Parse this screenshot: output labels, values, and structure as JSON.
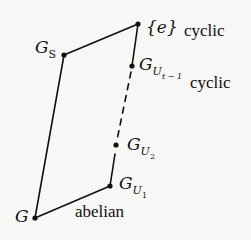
{
  "diagram": {
    "type": "subgroup-lattice",
    "nodes": [
      {
        "id": "G",
        "label_main": "G",
        "x": 35,
        "y": 218
      },
      {
        "id": "GS",
        "label_main": "G",
        "label_sub": "S",
        "x": 64,
        "y": 55
      },
      {
        "id": "e",
        "label_main": "{e}",
        "x": 138,
        "y": 24
      },
      {
        "id": "GUt1",
        "label_main": "G",
        "label_sub": "U",
        "label_subsub": "t − 1",
        "x": 132,
        "y": 66
      },
      {
        "id": "GU2",
        "label_main": "G",
        "label_sub": "U",
        "label_subsub": "2",
        "x": 116,
        "y": 145
      },
      {
        "id": "GU1",
        "label_main": "G",
        "label_sub": "U",
        "label_subsub": "1",
        "x": 110,
        "y": 186
      }
    ],
    "edges": [
      {
        "from": "G",
        "to": "GS",
        "style": "solid"
      },
      {
        "from": "GS",
        "to": "e",
        "style": "solid"
      },
      {
        "from": "e",
        "to": "GUt1",
        "style": "solid"
      },
      {
        "from": "GUt1",
        "to": "GU2",
        "style": "dashed"
      },
      {
        "from": "GU2",
        "to": "GU1",
        "style": "solid"
      },
      {
        "from": "GU1",
        "to": "G",
        "style": "solid"
      }
    ],
    "annotations": {
      "e_cyclic": "cyclic",
      "GUt1_cyclic": "cyclic",
      "G_abelian": "abelian"
    },
    "labels": {
      "G": "G",
      "GS_main": "G",
      "GS_sub": "S",
      "e": "{e}",
      "GUt1_main": "G",
      "GUt1_sub": "U",
      "GUt1_subsub": "t − 1",
      "GU2_main": "G",
      "GU2_sub": "U",
      "GU2_subsub": "2",
      "GU1_main": "G",
      "GU1_sub": "U",
      "GU1_subsub": "1"
    },
    "colors": {
      "line": "#111111",
      "background": "#f7f7f5"
    }
  }
}
